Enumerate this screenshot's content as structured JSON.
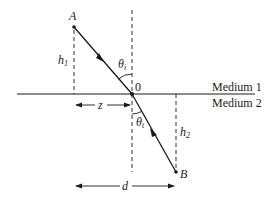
{
  "diagram": {
    "type": "refraction geometry",
    "points": {
      "A": "A",
      "B": "B",
      "origin": "0"
    },
    "angles": {
      "incident": {
        "symbol": "θ",
        "subscript": "i"
      },
      "transmitted": {
        "symbol": "θ",
        "subscript": "t"
      }
    },
    "lengths": {
      "h1": {
        "symbol": "h",
        "subscript": "1"
      },
      "h2": {
        "symbol": "h",
        "subscript": "2"
      },
      "z": "z",
      "d": "d"
    },
    "media": {
      "top": "Medium 1",
      "bottom": "Medium 2"
    },
    "colors": {
      "ink": "#1a1a1a",
      "background": "#ffffff"
    }
  }
}
